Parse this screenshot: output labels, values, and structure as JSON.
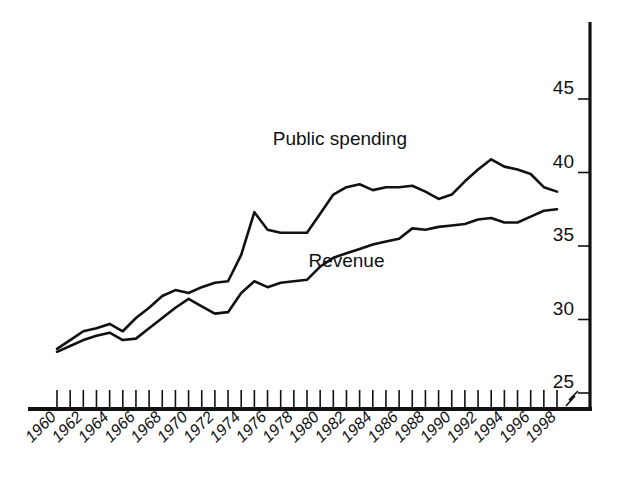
{
  "chart_data": {
    "type": "line",
    "title": "",
    "subtitle": "",
    "xlabel": "",
    "ylabel": "",
    "xlim": [
      1960,
      1998
    ],
    "ylim": [
      24.2,
      47.5
    ],
    "yticks": [
      25,
      30,
      35,
      40,
      45
    ],
    "ytick_labels": [
      "25",
      "30",
      "35",
      "40",
      "45"
    ],
    "grid": false,
    "legend_position": "inline-annotations",
    "axis_break_symbol": "z",
    "x": [
      1960,
      1961,
      1962,
      1963,
      1964,
      1965,
      1966,
      1967,
      1968,
      1969,
      1970,
      1971,
      1972,
      1973,
      1974,
      1975,
      1976,
      1977,
      1978,
      1979,
      1980,
      1981,
      1982,
      1983,
      1984,
      1985,
      1986,
      1987,
      1988,
      1989,
      1990,
      1991,
      1992,
      1993,
      1994,
      1995,
      1996,
      1997,
      1998
    ],
    "xtick_labels": [
      "1960",
      "1962",
      "1964",
      "1966",
      "1968",
      "1970",
      "1972",
      "1974",
      "1976",
      "1978",
      "1980",
      "1982",
      "1984",
      "1986",
      "1988",
      "1990",
      "1992",
      "1994",
      "1996",
      "1998"
    ],
    "xtick_values": [
      1960,
      1962,
      1964,
      1966,
      1968,
      1970,
      1972,
      1974,
      1976,
      1978,
      1980,
      1982,
      1984,
      1986,
      1988,
      1990,
      1992,
      1994,
      1996,
      1998
    ],
    "series": [
      {
        "name": "Public spending",
        "label": "Public spending",
        "label_x": 1981.5,
        "label_y": 41.9,
        "values": [
          28.0,
          28.6,
          29.2,
          29.4,
          29.7,
          29.2,
          30.1,
          30.8,
          31.6,
          32.0,
          31.8,
          32.2,
          32.5,
          32.6,
          34.4,
          37.3,
          36.1,
          35.9,
          35.9,
          35.9,
          37.2,
          38.5,
          39.0,
          39.2,
          38.8,
          39.0,
          39.0,
          39.1,
          38.7,
          38.2,
          38.5,
          39.4,
          40.2,
          40.9,
          40.4,
          40.2,
          39.9,
          39.0,
          38.7
        ]
      },
      {
        "name": "Revenue",
        "label": "Revenue",
        "label_x": 1982.0,
        "label_y": 33.6,
        "values": [
          27.8,
          28.2,
          28.6,
          28.9,
          29.1,
          28.6,
          28.7,
          29.4,
          30.1,
          30.8,
          31.4,
          30.9,
          30.4,
          30.5,
          31.8,
          32.6,
          32.2,
          32.5,
          32.6,
          32.7,
          33.6,
          34.2,
          34.5,
          34.8,
          35.1,
          35.3,
          35.5,
          36.2,
          36.1,
          36.3,
          36.4,
          36.5,
          36.8,
          36.9,
          36.6,
          36.6,
          37.0,
          37.4,
          37.5
        ]
      }
    ]
  }
}
